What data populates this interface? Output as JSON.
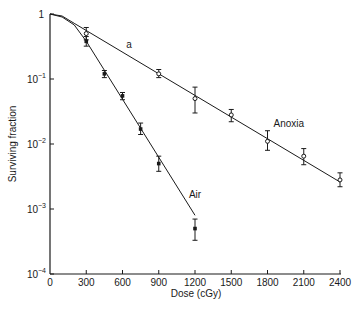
{
  "chart_data": {
    "type": "scatter",
    "title": "",
    "xlabel": "Dose (cGy)",
    "ylabel": "Surviving fraction",
    "xlim": [
      0,
      2400
    ],
    "ylim": [
      0.0001,
      1
    ],
    "yscale": "log",
    "grid": false,
    "legend": "inline labels",
    "x_ticks": [
      0,
      300,
      600,
      900,
      1200,
      1500,
      1800,
      2100,
      2400
    ],
    "y_ticks": [
      {
        "value": 1,
        "base": "1",
        "exp": ""
      },
      {
        "value": 0.1,
        "base": "10",
        "exp": "−1"
      },
      {
        "value": 0.01,
        "base": "10",
        "exp": "−2"
      },
      {
        "value": 0.001,
        "base": "10",
        "exp": "−3"
      },
      {
        "value": 0.0001,
        "base": "10",
        "exp": "−4"
      }
    ],
    "series": [
      {
        "name": "Anoxia",
        "marker": "open-circle",
        "x": [
          300,
          900,
          1200,
          1500,
          1800,
          2100,
          2400
        ],
        "values": [
          0.5,
          0.12,
          0.05,
          0.028,
          0.011,
          0.0065,
          0.0028
        ],
        "err_low": [
          0.4,
          0.105,
          0.03,
          0.022,
          0.008,
          0.0048,
          0.0022
        ],
        "err_high": [
          0.62,
          0.14,
          0.075,
          0.034,
          0.016,
          0.0085,
          0.0036
        ],
        "fit": [
          [
            0,
            1
          ],
          [
            100,
            0.93
          ],
          [
            200,
            0.72
          ],
          [
            2400,
            0.0026
          ]
        ],
        "label": "Anoxia",
        "label_pos": [
          1850,
          0.018
        ]
      },
      {
        "name": "Air",
        "marker": "filled-square",
        "x": [
          300,
          450,
          600,
          750,
          900,
          1200
        ],
        "values": [
          0.38,
          0.12,
          0.055,
          0.017,
          0.005,
          0.0005
        ],
        "err_low": [
          0.32,
          0.105,
          0.048,
          0.014,
          0.0038,
          0.00033
        ],
        "err_high": [
          0.45,
          0.135,
          0.062,
          0.021,
          0.0065,
          0.0007
        ],
        "fit": [
          [
            0,
            1
          ],
          [
            100,
            0.9
          ],
          [
            200,
            0.68
          ],
          [
            300,
            0.38
          ],
          [
            1200,
            0.0008
          ]
        ],
        "label": "Air",
        "label_pos": [
          1150,
          0.0015
        ]
      }
    ],
    "annotations": [
      {
        "text": "a",
        "x": 630,
        "y": 0.3
      }
    ]
  }
}
